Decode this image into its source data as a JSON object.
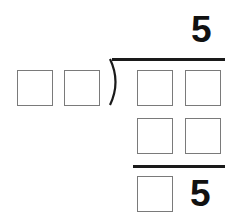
{
  "puzzle": {
    "type": "long-division-missing-digits",
    "quotient": "5",
    "divisor_boxes": 2,
    "dividend_boxes": 2,
    "product_boxes": 2,
    "remainder_boxes": 1,
    "remainder_known_digit": "5"
  },
  "colors": {
    "box_border": "#7a7a7a",
    "line": "#1a1a1a",
    "digit": "#111111"
  }
}
